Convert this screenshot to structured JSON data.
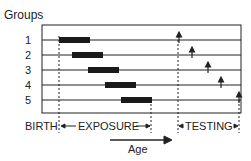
{
  "title": "Groups",
  "groups": [
    "1",
    "2",
    "3",
    "4",
    "5"
  ],
  "labels": {
    "birth": "BIRTH",
    "exposure": "EXPOSURE",
    "testing": "TESTING",
    "age": "Age"
  },
  "colors": {
    "ink": "#222222",
    "bar": "#1a1a1a",
    "background": "#ffffff"
  },
  "rows": [
    {
      "group": "1",
      "exposure_start": 59,
      "exposure_end": 90,
      "test_at": 179
    },
    {
      "group": "2",
      "exposure_start": 72,
      "exposure_end": 103,
      "test_at": 192
    },
    {
      "group": "3",
      "exposure_start": 88,
      "exposure_end": 119,
      "test_at": 208
    },
    {
      "group": "4",
      "exposure_start": 105,
      "exposure_end": 136,
      "test_at": 221
    },
    {
      "group": "5",
      "exposure_start": 121,
      "exposure_end": 152,
      "test_at": 239
    }
  ]
}
